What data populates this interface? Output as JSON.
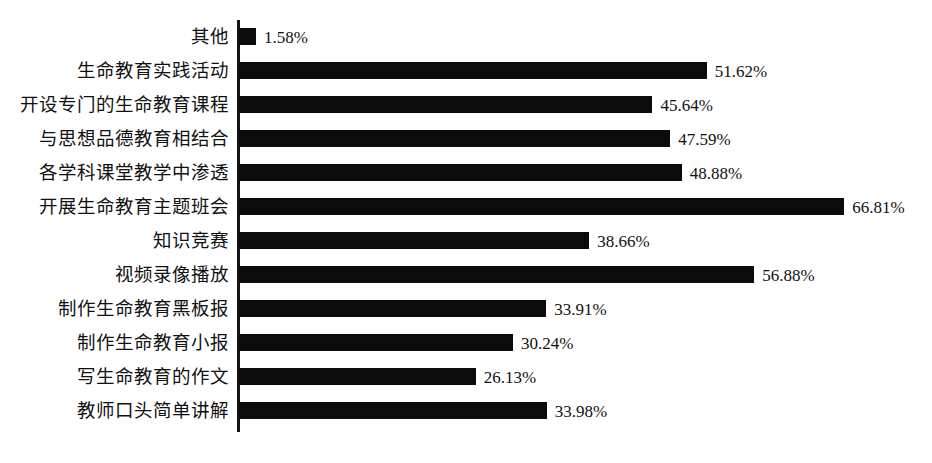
{
  "chart_data": {
    "type": "bar",
    "orientation": "horizontal",
    "title": "",
    "subtitle": "",
    "xlabel": "",
    "ylabel": "",
    "xlim": [
      0,
      66.81
    ],
    "grid": false,
    "legend": false,
    "value_suffix": "%",
    "categories": [
      "其他",
      "生命教育实践活动",
      "开设专门的生命教育课程",
      "与思想品德教育相结合",
      "各学科课堂教学中渗透",
      "开展生命教育主题班会",
      "知识竞赛",
      "视频录像播放",
      "制作生命教育黑板报",
      "制作生命教育小报",
      "写生命教育的作文",
      "教师口头简单讲解"
    ],
    "values": [
      1.58,
      51.62,
      45.64,
      47.59,
      48.88,
      66.81,
      38.66,
      56.88,
      33.91,
      30.24,
      26.13,
      33.98
    ],
    "value_labels": [
      "1.58%",
      "51.62%",
      "45.64%",
      "47.59%",
      "48.88%",
      "66.81%",
      "38.66%",
      "56.88%",
      "33.91%",
      "30.24%",
      "26.13%",
      "33.98%"
    ],
    "bar_color": "#0b0b0b",
    "axis_color": "#141414",
    "background_color": "#ffffff"
  },
  "rows": [
    {
      "label": "其他",
      "value_label": "1.58%"
    },
    {
      "label": "生命教育实践活动",
      "value_label": "51.62%"
    },
    {
      "label": "开设专门的生命教育课程",
      "value_label": "45.64%"
    },
    {
      "label": "与思想品德教育相结合",
      "value_label": "47.59%"
    },
    {
      "label": "各学科课堂教学中渗透",
      "value_label": "48.88%"
    },
    {
      "label": "开展生命教育主题班会",
      "value_label": "66.81%"
    },
    {
      "label": "知识竞赛",
      "value_label": "38.66%"
    },
    {
      "label": "视频录像播放",
      "value_label": "56.88%"
    },
    {
      "label": "制作生命教育黑板报",
      "value_label": "33.91%"
    },
    {
      "label": "制作生命教育小报",
      "value_label": "30.24%"
    },
    {
      "label": "写生命教育的作文",
      "value_label": "26.13%"
    },
    {
      "label": "教师口头简单讲解",
      "value_label": "33.98%"
    }
  ]
}
